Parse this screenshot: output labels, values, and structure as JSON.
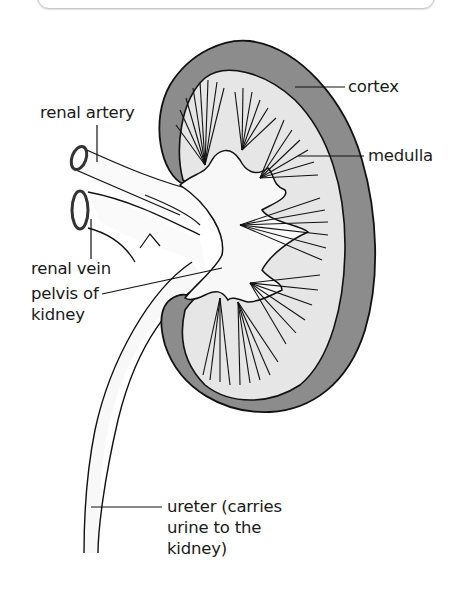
{
  "diagram": {
    "type": "anatomy",
    "colors": {
      "cortex": "#8c8c8c",
      "medulla": "#e6e6e6",
      "pelvis": "#f8f8f8",
      "outline": "#111111",
      "frame": "#c8c8c8"
    },
    "labels": {
      "cortex": {
        "lines": [
          "cortex"
        ]
      },
      "medulla": {
        "lines": [
          "medulla"
        ]
      },
      "renal_artery": {
        "lines": [
          "renal artery"
        ]
      },
      "renal_vein": {
        "lines": [
          "renal vein"
        ]
      },
      "pelvis": {
        "lines": [
          "pelvis of",
          "kidney"
        ]
      },
      "ureter": {
        "lines": [
          "ureter (carries",
          "urine to the",
          "kidney)"
        ]
      }
    }
  }
}
